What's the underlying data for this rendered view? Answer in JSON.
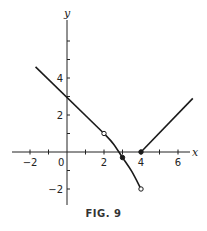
{
  "chart_data": {
    "type": "line",
    "title": "",
    "caption": "FIG. 9",
    "xlabel": "x",
    "ylabel": "y",
    "xlim": [
      -3,
      7
    ],
    "ylim": [
      -3,
      7
    ],
    "grid": false,
    "x_ticks": [
      -2,
      -1,
      1,
      2,
      3,
      4,
      5,
      6
    ],
    "x_tick_labels": [
      {
        "value": -2,
        "label": "−2"
      },
      {
        "value": 2,
        "label": "2"
      },
      {
        "value": 4,
        "label": "4"
      },
      {
        "value": 6,
        "label": "6"
      }
    ],
    "y_ticks": [
      -2,
      -1,
      1,
      2,
      3,
      4,
      5,
      6
    ],
    "y_tick_labels": [
      {
        "value": 4,
        "label": "4"
      },
      {
        "value": 2,
        "label": "2"
      },
      {
        "value": -2,
        "label": "−2"
      }
    ],
    "origin_label": "0",
    "series": [
      {
        "name": "segment-1-line",
        "kind": "line",
        "points": [
          [
            -1.7,
            4.6
          ],
          [
            2,
            1
          ]
        ]
      },
      {
        "name": "segment-2-curve",
        "kind": "curve",
        "points": [
          [
            2,
            1
          ],
          [
            2.5,
            0.45
          ],
          [
            3,
            -0.3
          ],
          [
            3.5,
            -1.05
          ],
          [
            4,
            -2
          ]
        ]
      },
      {
        "name": "segment-3-line",
        "kind": "line",
        "points": [
          [
            4,
            0
          ],
          [
            6.8,
            2.9
          ]
        ]
      }
    ],
    "markers": [
      {
        "x": 2,
        "y": 1,
        "style": "open"
      },
      {
        "x": 3,
        "y": -0.3,
        "style": "filled"
      },
      {
        "x": 4,
        "y": -2,
        "style": "open"
      },
      {
        "x": 4,
        "y": 0,
        "style": "filled"
      }
    ]
  }
}
